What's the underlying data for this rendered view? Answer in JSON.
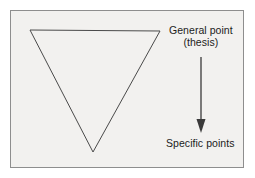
{
  "figure": {
    "background_color": "#ffffff",
    "panel_color": "#f2f1ef",
    "border_color": "#8e8e8e",
    "ink_color": "#3a3a3a",
    "text_color": "#1c1c1c"
  },
  "shapes": {
    "triangle": {
      "name": "inverted-triangle",
      "description": "Downward pointing triangle outline",
      "points": "30,30 160,31 93,152",
      "stroke": "#4a4a4a",
      "fill": "none",
      "stroke_width": 1
    },
    "arrow": {
      "name": "downward-arrow",
      "x": 201,
      "y_start": 57,
      "y_end": 133,
      "stroke": "#3a3a3a",
      "head_width": 9,
      "head_length": 14
    }
  },
  "labels": {
    "general_point": {
      "line1": "General point",
      "line2": "(thesis)"
    },
    "specific_points": "Specific points"
  }
}
